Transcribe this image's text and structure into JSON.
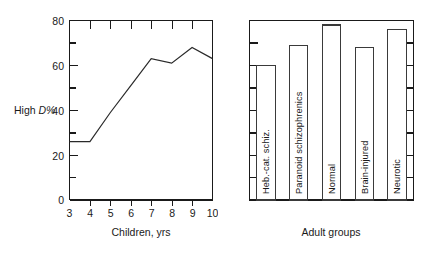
{
  "figure": {
    "background": "#ffffff",
    "ink_color": "#1a1a1a"
  },
  "chart_data": [
    {
      "type": "line",
      "id": "children-line-chart",
      "title": "",
      "xlabel": "Children, yrs",
      "ylabel": "High D%",
      "ylabel_plain": "High ",
      "ylabel_italic": "D%",
      "x": [
        3,
        4,
        5,
        6,
        7,
        8,
        9,
        10
      ],
      "values": [
        26,
        26,
        39,
        51,
        63,
        61,
        68,
        63
      ],
      "xlim": [
        3,
        10
      ],
      "ylim": [
        0,
        80
      ],
      "xticks": [
        3,
        4,
        5,
        6,
        7,
        8,
        9,
        10
      ],
      "xtick_labels": [
        "3",
        "4",
        "5",
        "6",
        "7",
        "8",
        "9",
        "10"
      ],
      "yticks": [
        0,
        20,
        40,
        60,
        80
      ],
      "ytick_labels": [
        "0",
        "20",
        "40",
        "60",
        "80"
      ],
      "yticks_minor": [
        10,
        30,
        50,
        70
      ],
      "grid": false,
      "legend": "none",
      "series": [
        {
          "name": "High D%",
          "values": [
            26,
            26,
            39,
            51,
            63,
            61,
            68,
            63
          ]
        }
      ]
    },
    {
      "type": "bar",
      "id": "adult-groups-bar-chart",
      "title": "",
      "xlabel": "Adult groups",
      "ylabel": "",
      "categories": [
        "Heb.-cat. schiz.",
        "Paranoid schizophrenics",
        "Normal",
        "Brain-injured",
        "Neurotic"
      ],
      "values": [
        60,
        69,
        78,
        68,
        76
      ],
      "ylim": [
        0,
        80
      ],
      "yticks_minor": [
        10,
        20,
        30,
        40,
        50,
        60,
        70
      ],
      "grid": false,
      "legend": "none",
      "axis_labels_visible": false,
      "bar_label_orientation": "vertical"
    }
  ],
  "panels": [
    {
      "name": "children",
      "axis_title": "Children, yrs",
      "y_axis_label_plain": "High ",
      "y_axis_label_italic": "D%"
    },
    {
      "name": "adults",
      "axis_title": "Adult groups"
    }
  ]
}
